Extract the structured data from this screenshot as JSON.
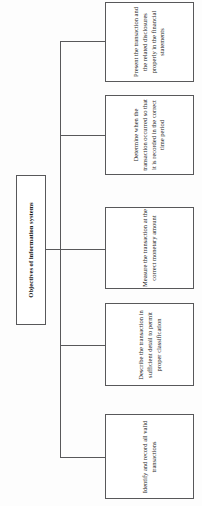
{
  "diagram": {
    "type": "tree",
    "orientation": "rotated-90-ccw",
    "root": {
      "label": "Objectives of information systems"
    },
    "children": [
      {
        "label": "Present the transaction and the related disclosures properly in the financial statements"
      },
      {
        "label": "Determine when the transaction occurred so that it is recorded in the correct time period"
      },
      {
        "label": "Measure the transaction at the correct monetary amount"
      },
      {
        "label": "Describe the transaction in sufficient detail to permit proper classification"
      },
      {
        "label": "Identify and record all valid transactions"
      }
    ],
    "colors": {
      "background": "#fdfdfd",
      "box_fill": "#ffffff",
      "box_border": "#58585a",
      "connector": "#58585a",
      "text": "#1a1a1a"
    }
  }
}
